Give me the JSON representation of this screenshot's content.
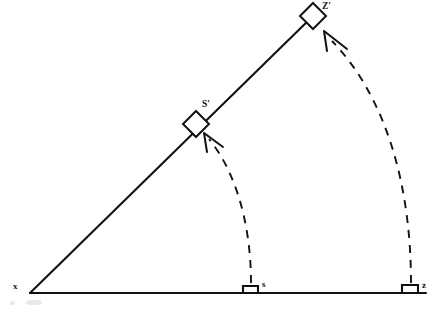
{
  "figure": {
    "type": "geometry-diagram",
    "background_color": "#ffffff",
    "ink_color": "#111111",
    "width": 433,
    "height": 310
  },
  "labels": {
    "vertex_x": "x",
    "foot_s": "s",
    "foot_z": "z",
    "image_s_prime": "S'",
    "image_z_prime": "Z'"
  },
  "points": {
    "x": {
      "cx": 30,
      "cy": 293
    },
    "s": {
      "cx": 251,
      "cy": 293
    },
    "z": {
      "cx": 411,
      "cy": 293
    },
    "s_prime": {
      "cx": 196,
      "cy": 124
    },
    "z_prime": {
      "cx": 313,
      "cy": 16
    }
  },
  "segments": {
    "baseline": {
      "x1": 30,
      "y1": 293,
      "x2": 426,
      "y2": 293
    },
    "hypotenuse": {
      "x1": 30,
      "y1": 293,
      "x2": 313,
      "y2": 16
    }
  },
  "right_angle_markers": [
    {
      "name": "right-angle-at-s",
      "x": 243,
      "y": 285,
      "size": 15
    },
    {
      "name": "right-angle-at-z",
      "x": 402,
      "y": 285,
      "size": 16
    }
  ],
  "diamond_markers": [
    {
      "name": "diamond-marker-s-prime",
      "cx": 196,
      "cy": 124,
      "radius": 13
    },
    {
      "name": "diamond-marker-z-prime",
      "cx": 313,
      "cy": 16,
      "radius": 13
    }
  ],
  "arcs": [
    {
      "name": "rotation-arc-s-to-s-prime",
      "from": "s",
      "to": "s_prime",
      "style": "dashed",
      "path": "M 251 283 C 251 225 236 172 209 139",
      "arrow": "M 222 146 L 205 134 M 207 151 L 205 134"
    },
    {
      "name": "rotation-arc-z-to-z-prime",
      "from": "z",
      "to": "z_prime",
      "style": "dashed",
      "path": "M 411 283 C 411 185 385 97 330 40",
      "arrow": "M 345 48 L 325 32 M 327 50 L 325 32"
    }
  ],
  "style": {
    "solid_stroke_width": 2.1,
    "dash_pattern": "8 7",
    "diamond_fill": "#ffffff"
  }
}
